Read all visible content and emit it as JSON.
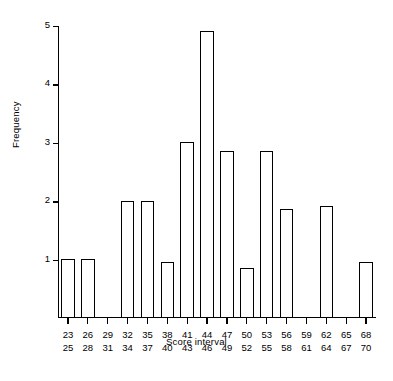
{
  "chart_data": {
    "type": "bar",
    "title": "",
    "subtitle": "",
    "xlabel": "Score interval",
    "ylabel": "Frequency",
    "categories": [
      "23–25",
      "26–28",
      "29–31",
      "32–34",
      "35–37",
      "38–40",
      "41–43",
      "44–46",
      "47–49",
      "50–52",
      "53–55",
      "56–58",
      "59–61",
      "62–64",
      "65–67",
      "68–70"
    ],
    "category_lines": [
      {
        "lower": "23",
        "upper": "25"
      },
      {
        "lower": "26",
        "upper": "28"
      },
      {
        "lower": "29",
        "upper": "31"
      },
      {
        "lower": "32",
        "upper": "34"
      },
      {
        "lower": "35",
        "upper": "37"
      },
      {
        "lower": "38",
        "upper": "40"
      },
      {
        "lower": "41",
        "upper": "43"
      },
      {
        "lower": "44",
        "upper": "46"
      },
      {
        "lower": "47",
        "upper": "49"
      },
      {
        "lower": "50",
        "upper": "52"
      },
      {
        "lower": "53",
        "upper": "55"
      },
      {
        "lower": "56",
        "upper": "58"
      },
      {
        "lower": "59",
        "upper": "61"
      },
      {
        "lower": "62",
        "upper": "64"
      },
      {
        "lower": "65",
        "upper": "67"
      },
      {
        "lower": "68",
        "upper": "70"
      }
    ],
    "values": [
      1,
      1,
      0,
      2,
      2,
      0.95,
      3,
      4.9,
      2.85,
      0.85,
      2.85,
      1.85,
      0,
      1.9,
      0,
      0.95
    ],
    "ylim": [
      0,
      5
    ],
    "ytick_labels": [
      "1",
      "2",
      "3",
      "4",
      "5"
    ],
    "ytick_values": [
      1,
      2,
      3,
      4,
      5
    ],
    "grid": false,
    "legend": false,
    "bar_fill_color": "#ffffff",
    "bar_edge_color": "#000000",
    "axis_color": "#000000",
    "background_color": "#ffffff"
  }
}
